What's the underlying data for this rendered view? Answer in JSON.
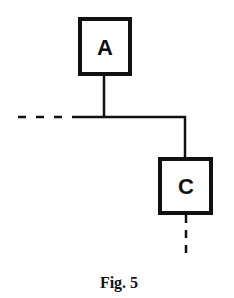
{
  "diagram": {
    "nodes": [
      {
        "id": "A",
        "label": "A"
      },
      {
        "id": "C",
        "label": "C"
      }
    ],
    "edges": [
      {
        "from": "left-dashed",
        "to": "junction",
        "style": "dashed-then-solid"
      },
      {
        "from": "A",
        "to": "junction",
        "style": "solid"
      },
      {
        "from": "junction",
        "to": "C",
        "style": "solid"
      },
      {
        "from": "C",
        "to": "bottom-dashed",
        "style": "dashed"
      }
    ],
    "caption": "Fig. 5",
    "colors": {
      "stroke": "#111111",
      "background": "#ffffff"
    }
  }
}
